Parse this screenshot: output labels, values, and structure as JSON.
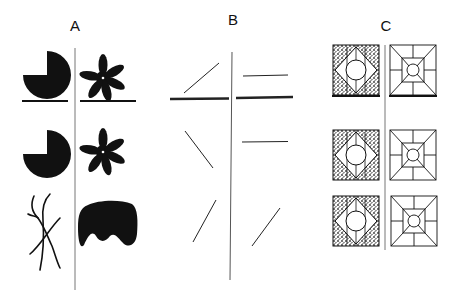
{
  "figure": {
    "panels": [
      {
        "label": "A",
        "x": 75,
        "y": 17
      },
      {
        "label": "B",
        "x": 233,
        "y": 11
      },
      {
        "label": "C",
        "x": 386,
        "y": 17
      }
    ],
    "colors": {
      "ink": "#111111",
      "divider": "#777777",
      "stipple": "#555555"
    }
  }
}
